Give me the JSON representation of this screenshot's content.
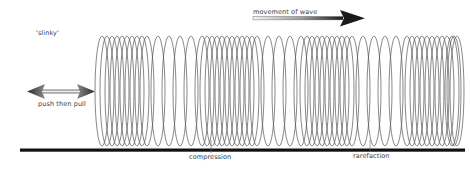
{
  "labels": {
    "slinky": "'slinky'",
    "movement": "movement of wave",
    "push_pull": "push then pull",
    "compression": "compression",
    "rarefaction": "rarefaction"
  },
  "colors": {
    "coil": "#555555",
    "ground": "#111111",
    "arrow_dark": "#1a1a1a",
    "arrow_light": "#e8e8e8"
  },
  "slinky": {
    "x_start": 95,
    "x_end": 455,
    "y_top": 36,
    "y_bottom": 146,
    "zones": [
      {
        "type": "compression",
        "from": 95,
        "to": 140
      },
      {
        "type": "rarefaction",
        "from": 140,
        "to": 195
      },
      {
        "type": "compression",
        "from": 195,
        "to": 250
      },
      {
        "type": "rarefaction",
        "from": 250,
        "to": 300
      },
      {
        "type": "compression",
        "from": 300,
        "to": 345
      },
      {
        "type": "rarefaction",
        "from": 345,
        "to": 400
      },
      {
        "type": "compression",
        "from": 400,
        "to": 452
      }
    ]
  },
  "ground_line": {
    "x1": 20,
    "x2": 465,
    "y": 150
  }
}
